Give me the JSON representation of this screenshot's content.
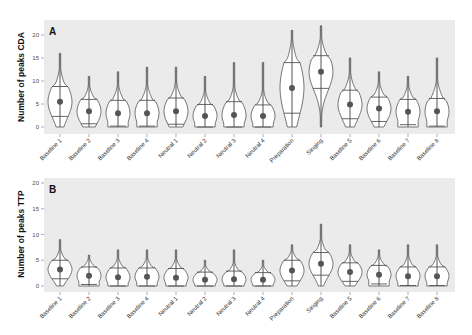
{
  "chart_data": [
    {
      "type": "violin",
      "panel": "A",
      "title": "",
      "xlabel": "",
      "ylabel": "Number of peaks CDA",
      "ylim": [
        0,
        20
      ],
      "yticks": [
        0,
        5,
        10,
        15,
        20
      ],
      "grid": false,
      "legend": null,
      "categories": [
        "Baseline 1",
        "Baseline 2",
        "Baseline 3",
        "Baseline 4",
        "Neutral 1",
        "Neutral 2",
        "Neutral 3",
        "Neutral 4",
        "Preparation",
        "Singing",
        "Baseline 5",
        "Baseline 6",
        "Baseline 7",
        "Baseline 8"
      ],
      "series": [
        {
          "name": "mean",
          "values": [
            5.5,
            3.4,
            3.0,
            3.0,
            3.4,
            2.4,
            2.6,
            2.4,
            8.5,
            12.0,
            4.9,
            4.0,
            3.3,
            3.4
          ]
        },
        {
          "name": "sd_upper",
          "values": [
            8.8,
            6.0,
            5.8,
            5.8,
            6.3,
            4.9,
            5.5,
            4.8,
            14.0,
            15.5,
            8.0,
            6.5,
            6.0,
            6.2
          ]
        },
        {
          "name": "sd_lower",
          "values": [
            2.3,
            0.7,
            0.2,
            0.2,
            0.6,
            0,
            0,
            0,
            3.0,
            8.4,
            1.8,
            1.2,
            0.5,
            0.2
          ]
        },
        {
          "name": "max",
          "values": [
            16,
            11,
            12,
            13,
            13,
            11,
            14,
            14,
            21,
            22,
            15,
            12,
            11,
            15
          ]
        },
        {
          "name": "min",
          "values": [
            0,
            0,
            0,
            0,
            0,
            0,
            0,
            0,
            0,
            0,
            0,
            0,
            0,
            0
          ]
        }
      ]
    },
    {
      "type": "violin",
      "panel": "B",
      "title": "",
      "xlabel": "",
      "ylabel": "Number of peaks TTP",
      "ylim": [
        0,
        20
      ],
      "yticks": [
        0,
        5,
        10,
        15,
        20
      ],
      "grid": false,
      "legend": null,
      "categories": [
        "Baseline 1",
        "Baseline 2",
        "Baseline 3",
        "Baseline 4",
        "Neutral 1",
        "Neutral 2",
        "Neutral 3",
        "Neutral 4",
        "Preparation",
        "Singing",
        "Baseline 5",
        "Baseline 6",
        "Baseline 7",
        "Baseline 8"
      ],
      "series": [
        {
          "name": "mean",
          "values": [
            3.2,
            2.0,
            1.7,
            1.8,
            1.6,
            1.2,
            1.3,
            1.2,
            3.0,
            4.3,
            2.7,
            2.2,
            1.9,
            1.9
          ]
        },
        {
          "name": "sd_upper",
          "values": [
            5.0,
            3.7,
            3.5,
            3.5,
            3.4,
            2.7,
            2.9,
            2.6,
            5.0,
            6.5,
            4.5,
            4.0,
            3.7,
            3.7
          ]
        },
        {
          "name": "sd_lower",
          "values": [
            1.4,
            0.3,
            0,
            0,
            0,
            0,
            0,
            0,
            1.0,
            2.1,
            0.9,
            0.4,
            0.1,
            0.1
          ]
        },
        {
          "name": "max",
          "values": [
            9,
            6,
            7,
            7,
            7,
            5,
            7,
            5,
            8,
            12,
            8,
            7,
            8,
            8
          ]
        },
        {
          "name": "min",
          "values": [
            0,
            0,
            0,
            0,
            0,
            0,
            0,
            0,
            0,
            0,
            0,
            0,
            0,
            0
          ]
        }
      ]
    }
  ],
  "panels": {
    "a": {
      "letter": "A",
      "ylabel": "Number of peaks CDA"
    },
    "b": {
      "letter": "B",
      "ylabel": "Number of peaks TTP"
    }
  },
  "colors": {
    "panel_background": "#ebebeb",
    "violin_fill": "#ffffff",
    "violin_stroke": "#555555",
    "mean_point": "#555555"
  }
}
